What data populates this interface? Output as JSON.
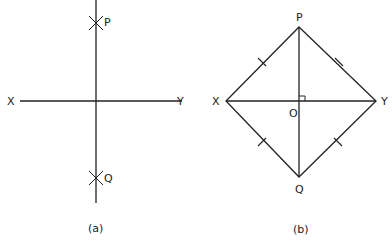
{
  "figure_a": {
    "caption": "(a)",
    "labels": {
      "p": "P",
      "q": "Q",
      "x": "X",
      "y": "Y"
    }
  },
  "figure_b": {
    "caption": "(b)",
    "labels": {
      "p": "P",
      "q": "Q",
      "x": "X",
      "y": "Y",
      "o": "O"
    }
  },
  "colors": {
    "stroke": "#222222",
    "background": "#ffffff"
  }
}
